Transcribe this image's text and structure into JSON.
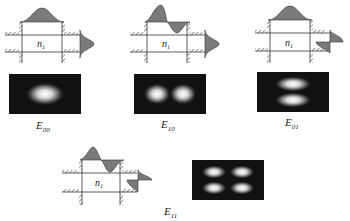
{
  "colors": {
    "line": "#333333",
    "fill": "#7a7a7a",
    "image_bg": "#111111",
    "glow": "#ffffff"
  },
  "diagram": {
    "core_label": "n",
    "core_label_sub": "1",
    "modes": [
      {
        "id": "E00",
        "label_main": "E",
        "label_sub": "00",
        "x_lobes": 1,
        "y_lobes": 1
      },
      {
        "id": "E10",
        "label_main": "E",
        "label_sub": "10",
        "x_lobes": 2,
        "y_lobes": 1
      },
      {
        "id": "E01",
        "label_main": "E",
        "label_sub": "01",
        "x_lobes": 1,
        "y_lobes": 2
      },
      {
        "id": "E11",
        "label_main": "E",
        "label_sub": "11",
        "x_lobes": 2,
        "y_lobes": 2
      }
    ]
  }
}
